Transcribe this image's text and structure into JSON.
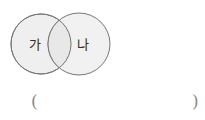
{
  "figure": {
    "type": "venn-diagram-two-sets",
    "background_color": "#ffffff",
    "circle_fill_color": "#efefef",
    "circle_stroke_color": "#767676",
    "overlap_fill_color": "#e8e8e8",
    "label_color": "#2b2b2b",
    "circles": [
      {
        "id": "set-ga",
        "label": "가",
        "cx": 41,
        "cy": 44,
        "r": 30,
        "label_x": 35,
        "label_y": 44
      },
      {
        "id": "set-na",
        "label": "나",
        "cx": 79,
        "cy": 44,
        "r": 31,
        "label_x": 83,
        "label_y": 44
      }
    ]
  },
  "answer": {
    "open_paren": "(",
    "close_paren": ")",
    "value": "",
    "placeholder": ""
  }
}
